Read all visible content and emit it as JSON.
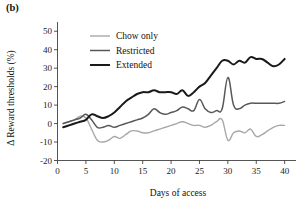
{
  "panel": {
    "label": "(b)"
  },
  "chart_data": {
    "type": "line",
    "title": "",
    "xlabel": "Days of access",
    "ylabel": "Δ Reward thresholds (%)",
    "xlim": [
      0,
      42
    ],
    "ylim": [
      -20,
      55
    ],
    "xticks": [
      0,
      5,
      10,
      15,
      20,
      25,
      30,
      35,
      40
    ],
    "xticklabels": [
      "0",
      "5",
      "10",
      "15",
      "20",
      "25",
      "30",
      "35",
      "40"
    ],
    "yticks": [
      -20,
      -10,
      0,
      10,
      20,
      30,
      40,
      50
    ],
    "yticklabels": [
      "-20",
      "-10",
      "0",
      "10",
      "20",
      "30",
      "40",
      "50"
    ],
    "grid": false,
    "legend_position": "top-center",
    "x": [
      1,
      2,
      3,
      4,
      5,
      6,
      7,
      8,
      9,
      10,
      11,
      12,
      13,
      14,
      15,
      16,
      17,
      18,
      19,
      20,
      21,
      22,
      23,
      24,
      25,
      26,
      27,
      28,
      29,
      30,
      31,
      32,
      33,
      34,
      35,
      36,
      37,
      38,
      39,
      40
    ],
    "series": [
      {
        "name": "Chow only",
        "color": "#a8a8a8",
        "width": 1.4,
        "values": [
          0,
          1,
          2,
          4,
          3,
          -3,
          -9,
          -10,
          -9,
          -7,
          -8,
          -6,
          -4,
          -4,
          -5,
          -5,
          -4,
          -3,
          -2,
          -1,
          0,
          1,
          0,
          -1,
          -1,
          -2,
          -1,
          1,
          2,
          -9,
          -5,
          -4,
          -5,
          -3,
          -7,
          -6,
          -4,
          -2,
          -1,
          -1
        ]
      },
      {
        "name": "Restricted",
        "color": "#585858",
        "width": 1.5,
        "values": [
          0,
          1,
          2,
          3,
          5,
          2,
          -2,
          -2,
          -1,
          -2,
          -1,
          0,
          1,
          2,
          3,
          5,
          8,
          6,
          5,
          6,
          7,
          9,
          8,
          7,
          13,
          8,
          6,
          7,
          8,
          25,
          10,
          8,
          10,
          11,
          11,
          11,
          11,
          11,
          11,
          12
        ]
      },
      {
        "name": "Extended",
        "color": "#1a1a1a",
        "width": 2.0,
        "values": [
          -2,
          -1,
          0,
          1,
          2,
          5,
          4,
          3,
          4,
          6,
          9,
          12,
          14,
          16,
          17,
          17,
          18,
          17,
          17,
          17,
          16,
          18,
          15,
          17,
          20,
          22,
          26,
          30,
          34,
          34,
          32,
          34,
          33,
          36,
          35,
          35,
          33,
          31,
          32,
          35
        ]
      }
    ]
  }
}
